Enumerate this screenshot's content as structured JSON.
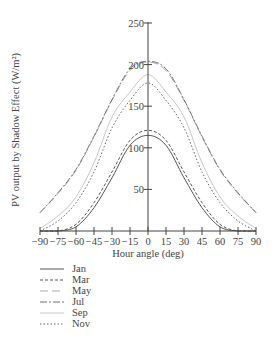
{
  "chart_data": {
    "type": "line",
    "title": "",
    "xlabel": "Hour angle (deg)",
    "ylabel": "PV output by Shadow Effect (W/m²)",
    "xlim": [
      -90,
      90
    ],
    "ylim": [
      0,
      250
    ],
    "x_ticks": [
      -90,
      -75,
      -60,
      -45,
      -30,
      -15,
      0,
      15,
      30,
      45,
      60,
      75,
      90
    ],
    "y_ticks": [
      50,
      100,
      150,
      200,
      250
    ],
    "grid": false,
    "legend_position": "below-left",
    "x": [
      -90,
      -75,
      -60,
      -45,
      -30,
      -15,
      0,
      15,
      30,
      45,
      60,
      75,
      90
    ],
    "series": [
      {
        "name": "Jan",
        "style": "solid",
        "color": "#555555",
        "values": [
          0,
          0,
          5,
          28,
          64,
          103,
          115,
          103,
          64,
          28,
          5,
          0,
          0
        ]
      },
      {
        "name": "Mar",
        "style": "dashed",
        "color": "#555555",
        "values": [
          0,
          0,
          8,
          34,
          71,
          109,
          121,
          109,
          71,
          34,
          8,
          0,
          0
        ]
      },
      {
        "name": "May",
        "style": "longdash",
        "color": "#aaaaaa",
        "values": [
          22,
          45,
          73,
          113,
          157,
          193,
          203,
          193,
          157,
          113,
          73,
          45,
          22
        ]
      },
      {
        "name": "Jul",
        "style": "dashdot",
        "color": "#777777",
        "values": [
          22,
          46,
          74,
          114,
          158,
          195,
          204,
          195,
          158,
          114,
          74,
          46,
          22
        ]
      },
      {
        "name": "Sep",
        "style": "solid",
        "color": "#c8c8c8",
        "values": [
          3,
          18,
          41,
          82,
          137,
          167,
          188,
          167,
          137,
          82,
          41,
          18,
          3
        ]
      },
      {
        "name": "Nov",
        "style": "dotted",
        "color": "#666666",
        "values": [
          0,
          12,
          34,
          71,
          124,
          157,
          178,
          157,
          124,
          71,
          34,
          12,
          0
        ]
      }
    ]
  },
  "axes": {
    "x_tick_labels": [
      "-90",
      "-75",
      "-60",
      "-45",
      "-30",
      "-15",
      "0",
      "15",
      "30",
      "45",
      "60",
      "75",
      "90"
    ],
    "y_tick_labels": [
      "50",
      "100",
      "150",
      "200",
      "250"
    ]
  },
  "legend": {
    "items": [
      {
        "label": "Jan"
      },
      {
        "label": "Mar"
      },
      {
        "label": "May"
      },
      {
        "label": "Jul"
      },
      {
        "label": "Sep"
      },
      {
        "label": "Nov"
      }
    ]
  }
}
